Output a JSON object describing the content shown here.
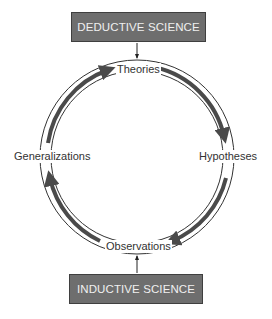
{
  "diagram": {
    "boxes": {
      "top": "DEDUCTIVE SCIENCE",
      "bottom": "INDUCTIVE SCIENCE"
    },
    "cycle_nodes": {
      "top": "Theories",
      "right": "Hypotheses",
      "bottom": "Observations",
      "left": "Generalizations"
    },
    "flow": [
      {
        "from": "Theories",
        "to": "Hypotheses"
      },
      {
        "from": "Hypotheses",
        "to": "Observations"
      },
      {
        "from": "Observations",
        "to": "Generalizations"
      },
      {
        "from": "Generalizations",
        "to": "Theories"
      }
    ],
    "entry_arrows": [
      {
        "from": "DEDUCTIVE SCIENCE",
        "to": "Theories"
      },
      {
        "from": "INDUCTIVE SCIENCE",
        "to": "Observations"
      }
    ],
    "colors": {
      "box_fill": "#6e6e6e",
      "box_text": "#f0f0f0",
      "arrow": "#4a4a4a",
      "ring": "#333333"
    }
  }
}
